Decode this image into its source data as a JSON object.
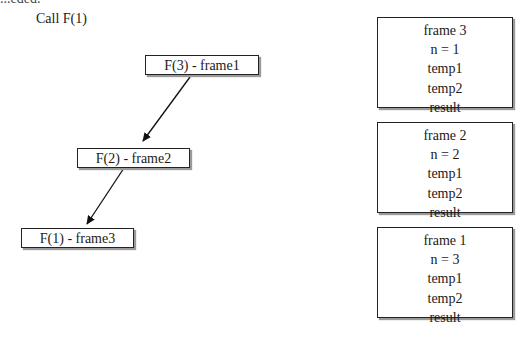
{
  "clipped_top_text": "...eded.",
  "caption": "Call F(1)",
  "call_tree": {
    "nodes": [
      {
        "id": "f3",
        "label": "F(3) - frame1"
      },
      {
        "id": "f2",
        "label": "F(2) - frame2"
      },
      {
        "id": "f1",
        "label": "F(1) - frame3"
      }
    ],
    "edges": [
      {
        "from": "f3",
        "to": "f2"
      },
      {
        "from": "f2",
        "to": "f1"
      }
    ]
  },
  "stack_frames": [
    {
      "title": "frame 3",
      "lines": [
        "n = 1",
        "temp1",
        "temp2",
        "result"
      ]
    },
    {
      "title": "frame 2",
      "lines": [
        "n = 2",
        "temp1",
        "temp2",
        "result"
      ]
    },
    {
      "title": "frame 1",
      "lines": [
        "n = 3",
        "temp1",
        "temp2",
        "result"
      ]
    }
  ]
}
